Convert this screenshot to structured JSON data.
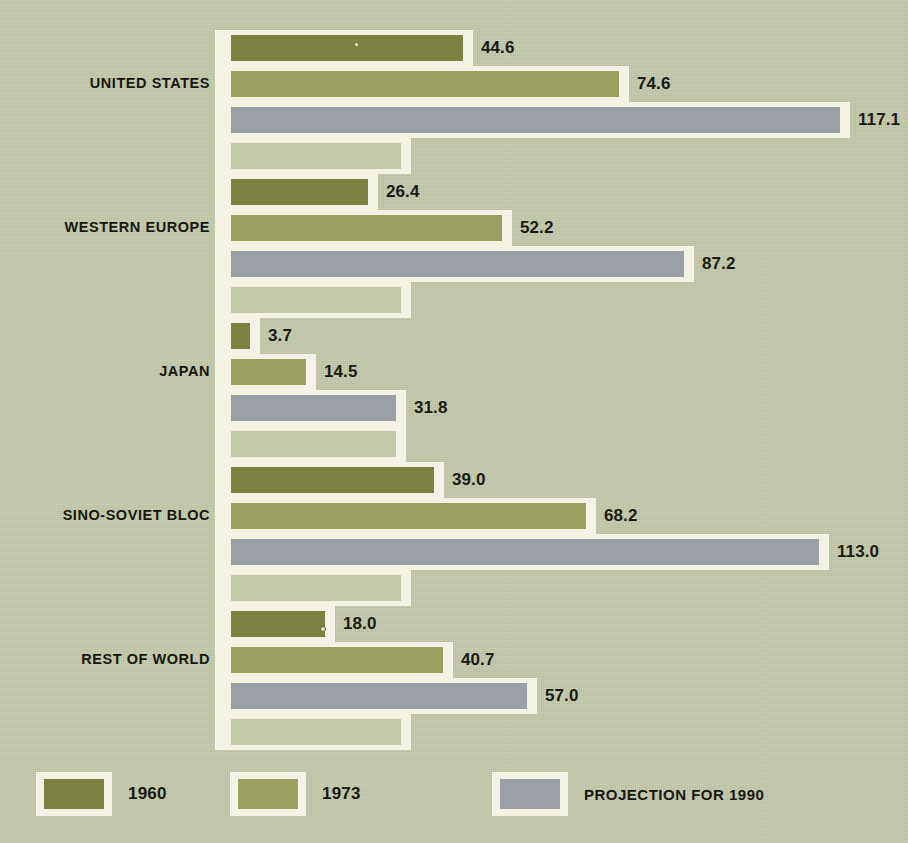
{
  "chart_data": {
    "type": "bar",
    "orientation": "horizontal",
    "title": "",
    "subtitle": "",
    "xlabel": "",
    "ylabel": "",
    "grid": false,
    "legend_position": "bottom",
    "axis_origin_value": 0,
    "xlim": [
      0,
      117.1
    ],
    "categories": [
      "UNITED STATES",
      "WESTERN EUROPE",
      "JAPAN",
      "SINO-SOVIET BLOC",
      "REST OF WORLD"
    ],
    "series": [
      {
        "name": "1960",
        "color": "#7d8140",
        "values": [
          44.6,
          26.4,
          3.7,
          39.0,
          18.0
        ],
        "labels": [
          "44.6",
          "26.4",
          "3.7",
          "39.0",
          "18.0"
        ]
      },
      {
        "name": "1973",
        "color": "#9aa05e",
        "values": [
          74.6,
          52.2,
          14.5,
          68.2,
          40.7
        ],
        "labels": [
          "74.6",
          "52.2",
          "14.5",
          "68.2",
          "40.7"
        ]
      },
      {
        "name": "PROJECTION FOR 1990",
        "color": "#9ba0a6",
        "values": [
          117.1,
          87.2,
          31.8,
          113.0,
          57.0
        ],
        "labels": [
          "117.1",
          "87.2",
          "31.8",
          "113.0",
          "57.0"
        ]
      }
    ]
  },
  "legend": {
    "items": [
      {
        "label": "1960",
        "color": "#7d8140"
      },
      {
        "label": "1973",
        "color": "#9aa05e"
      },
      {
        "label": "PROJECTION FOR 1990",
        "color": "#9ba0a6"
      }
    ]
  },
  "colors": {
    "background": "#c2c9a8",
    "mat": "#f4f2e4",
    "series_1960": "#7d8140",
    "series_1973": "#9aa05e",
    "series_1990": "#9ba0a6",
    "text": "#17170f"
  }
}
